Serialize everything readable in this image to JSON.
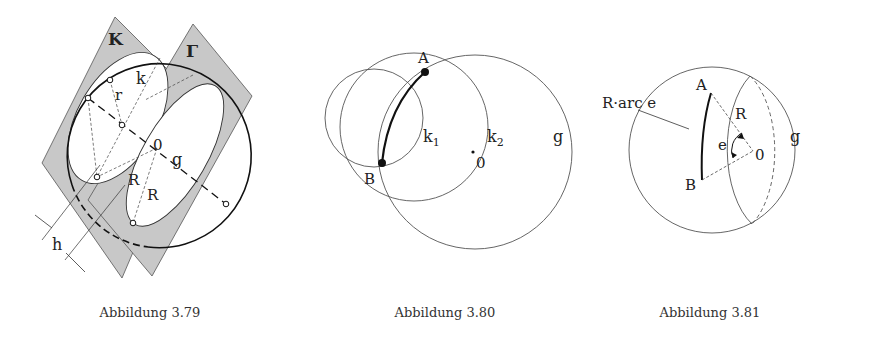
{
  "figures": [
    {
      "id": "3.79",
      "caption": "Abbildung 3.79",
      "labels": {
        "plane_k": "K",
        "plane_gamma": "Γ",
        "small_circle": "k",
        "radius_small": "r",
        "center": "0",
        "axis": "g",
        "radius_big_1": "R",
        "radius_big_2": "R",
        "distance": "h"
      }
    },
    {
      "id": "3.80",
      "caption": "Abbildung 3.80",
      "labels": {
        "point_a": "A",
        "point_b": "B",
        "circle_k1": "k",
        "circle_k1_sub": "1",
        "circle_k2": "k",
        "circle_k2_sub": "2",
        "center": "0",
        "great_circle": "g"
      }
    },
    {
      "id": "3.81",
      "caption": "Abbildung 3.81",
      "labels": {
        "arc_length": "R·arc e",
        "point_a": "A",
        "point_b": "B",
        "radius": "R",
        "angle": "e",
        "center": "0",
        "great_circle": "g"
      }
    }
  ],
  "colors": {
    "plane_fill": "#c8c8c8",
    "line": "#222222",
    "thin_line": "#555555"
  }
}
